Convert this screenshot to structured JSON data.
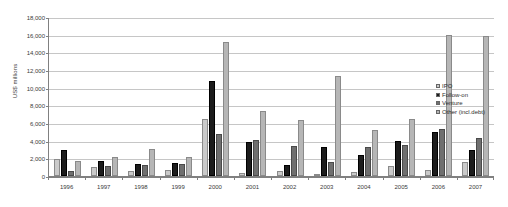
{
  "chart_data": {
    "type": "bar",
    "title": "",
    "xlabel": "",
    "ylabel": "US$ millions",
    "ylim": [
      0,
      18000
    ],
    "ytick_step": 2000,
    "ytick_labels": [
      "18,000",
      "16,000",
      "14,000",
      "12,000",
      "10,000",
      "8,000",
      "6,000",
      "4,000",
      "2,000",
      "0"
    ],
    "grid": true,
    "legend_position": "inside-right",
    "categories": [
      "1996",
      "1997",
      "1998",
      "1999",
      "2000",
      "2001",
      "2002",
      "2003",
      "2004",
      "2005",
      "2006",
      "2007"
    ],
    "series": [
      {
        "name": "IPO",
        "color": "#cacaca",
        "values": [
          1950,
          980,
          520,
          700,
          6400,
          300,
          600,
          250,
          420,
          1100,
          700,
          1550
        ]
      },
      {
        "name": "Follow-on",
        "color": "#1c1c1c",
        "values": [
          2900,
          1750,
          1350,
          1450,
          10800,
          3800,
          1200,
          3250,
          2350,
          4000,
          4950,
          2950
        ]
      },
      {
        "name": "Venture",
        "color": "#6f6f6f",
        "values": [
          620,
          1150,
          1250,
          1400,
          4700,
          4100,
          3350,
          1600,
          3250,
          3500,
          5350,
          4300
        ]
      },
      {
        "name": "Other (incl.debt)",
        "color": "#b6b6b6",
        "values": [
          1700,
          2150,
          3050,
          2150,
          15200,
          7400,
          6350,
          11300,
          5200,
          6450,
          15950,
          15800
        ]
      }
    ]
  },
  "legend": {
    "entries": [
      {
        "label": "IPO"
      },
      {
        "label": "Follow-on"
      },
      {
        "label": "Venture"
      },
      {
        "label": "Other (incl.debt)"
      }
    ]
  }
}
